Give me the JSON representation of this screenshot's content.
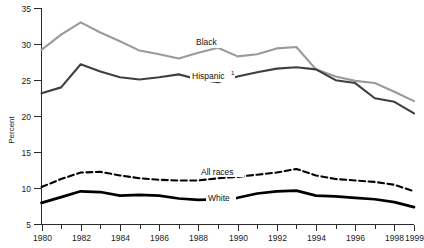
{
  "chart_data": {
    "type": "line",
    "title": "",
    "xlabel": "",
    "ylabel": "Percent",
    "xlim": [
      1980,
      1999
    ],
    "ylim": [
      5,
      35
    ],
    "ytick_values": [
      5,
      10,
      15,
      20,
      25,
      30,
      35
    ],
    "ytick_labels": [
      "5",
      "10",
      "15",
      "20",
      "25",
      "30",
      "35"
    ],
    "xtick_values": [
      1980,
      1981,
      1982,
      1983,
      1984,
      1985,
      1986,
      1987,
      1988,
      1989,
      1990,
      1991,
      1992,
      1993,
      1994,
      1995,
      1996,
      1997,
      1998,
      1999
    ],
    "xtick_labels": [
      "1980",
      "",
      "1982",
      "",
      "1984",
      "",
      "1986",
      "",
      "1988",
      "",
      "1990",
      "",
      "1992",
      "",
      "1994",
      "",
      "1996",
      "",
      "1998",
      "1999"
    ],
    "grid": false,
    "legend_position": "inline-annotation",
    "x": [
      1980,
      1981,
      1982,
      1983,
      1984,
      1985,
      1986,
      1987,
      1988,
      1989,
      1990,
      1991,
      1992,
      1993,
      1994,
      1995,
      1996,
      1997,
      1998,
      1999
    ],
    "series": [
      {
        "name": "Black",
        "label": "Black",
        "color": "#9a9a9a",
        "style": "solid",
        "width": 2.1,
        "values": [
          29.2,
          31.3,
          33.0,
          31.6,
          30.4,
          29.1,
          28.6,
          28.0,
          28.8,
          29.5,
          28.3,
          28.6,
          29.4,
          29.6,
          26.5,
          25.5,
          24.9,
          24.6,
          23.4,
          22.1
        ]
      },
      {
        "name": "Hispanic",
        "label": "Hispanic",
        "footnote_marker": "1",
        "color": "#3f3f3f",
        "style": "solid",
        "width": 2.1,
        "values": [
          23.2,
          24.0,
          27.2,
          26.2,
          25.4,
          25.1,
          25.4,
          25.8,
          25.1,
          24.7,
          25.5,
          26.1,
          26.6,
          26.8,
          26.5,
          25.0,
          24.6,
          22.5,
          22.0,
          20.4
        ]
      },
      {
        "name": "All races",
        "label": "All races",
        "color": "#000000",
        "style": "dashed",
        "width": 2.1,
        "values": [
          10.2,
          11.3,
          12.2,
          12.3,
          11.8,
          11.4,
          11.2,
          11.1,
          11.1,
          11.4,
          11.6,
          11.9,
          12.2,
          12.7,
          11.8,
          11.3,
          11.1,
          10.9,
          10.5,
          9.6
        ]
      },
      {
        "name": "White",
        "label": "White",
        "color": "#000000",
        "style": "solid",
        "width": 2.7,
        "values": [
          8.0,
          8.8,
          9.6,
          9.5,
          9.0,
          9.1,
          9.0,
          8.6,
          8.4,
          8.5,
          8.7,
          9.3,
          9.6,
          9.7,
          9.0,
          8.9,
          8.7,
          8.5,
          8.1,
          7.4
        ]
      }
    ]
  }
}
